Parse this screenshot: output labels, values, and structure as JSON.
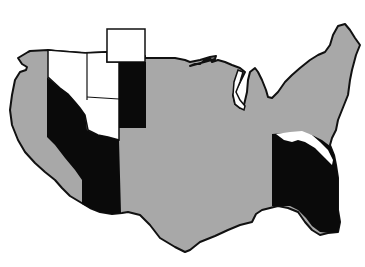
{
  "map": {
    "type": "us-outline-map",
    "colors": {
      "background": "#ffffff",
      "gray_region": "#a8a8a8",
      "black_region": "#0a0a0a",
      "white_region": "#ffffff",
      "outline": "#111111"
    },
    "regions": [
      {
        "name": "mainland-gray",
        "fill": "gray"
      },
      {
        "name": "west-black-band",
        "fill": "black"
      },
      {
        "name": "west-white-states",
        "fill": "white"
      },
      {
        "name": "north-white-box",
        "fill": "white"
      },
      {
        "name": "central-black-strip",
        "fill": "black"
      },
      {
        "name": "southeast-black-region",
        "fill": "black"
      },
      {
        "name": "southeast-white-sliver",
        "fill": "white"
      }
    ]
  }
}
